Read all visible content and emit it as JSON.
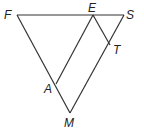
{
  "diagram": {
    "type": "geometry-figure",
    "points": {
      "F": {
        "label": "F",
        "x": 17,
        "y": 15
      },
      "E": {
        "label": "E",
        "x": 93,
        "y": 15
      },
      "S": {
        "label": "S",
        "x": 124,
        "y": 15
      },
      "T": {
        "label": "T",
        "x": 110,
        "y": 43
      },
      "A": {
        "label": "A",
        "x": 56,
        "y": 84
      },
      "M": {
        "label": "M",
        "x": 70,
        "y": 113
      }
    },
    "segments": [
      "FS",
      "FM",
      "SM",
      "EA",
      "ET"
    ]
  }
}
